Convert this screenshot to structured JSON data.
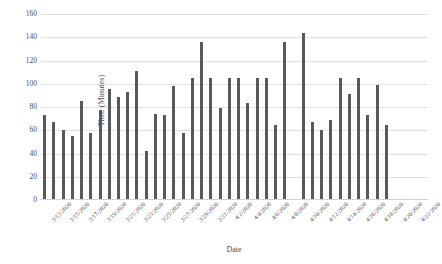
{
  "chart_data": {
    "type": "bar",
    "title": "",
    "xlabel": "Date",
    "ylabel": "Time (Minutes)",
    "ylim": [
      0,
      160
    ],
    "y_ticks": [
      0,
      20,
      40,
      60,
      80,
      100,
      120,
      140,
      160
    ],
    "grid": true,
    "legend": false,
    "bar_color": "#595959",
    "categories": [
      "3/13/2020",
      "3/14/2020",
      "3/15/2020",
      "3/16/2020",
      "3/17/2020",
      "3/18/2020",
      "3/19/2020",
      "3/20/2020",
      "3/21/2020",
      "3/22/2020",
      "3/23/2020",
      "3/24/2020",
      "3/25/2020",
      "3/26/2020",
      "3/27/2020",
      "3/28/2020",
      "3/29/2020",
      "3/30/2020",
      "3/31/2020",
      "4/1/2020",
      "4/2/2020",
      "4/3/2020",
      "4/4/2020",
      "4/5/2020",
      "4/6/2020",
      "4/7/2020",
      "4/8/2020",
      "4/9/2020",
      "4/10/2020",
      "4/11/2020",
      "4/12/2020",
      "4/13/2020",
      "4/14/2020",
      "4/15/2020",
      "4/16/2020",
      "4/17/2020",
      "4/18/2020",
      "4/19/2020",
      "4/20/2020",
      "4/21/2020",
      "4/22/2020",
      "4/23/2020"
    ],
    "tick_labels": [
      "3/13/2020",
      "3/15/2020",
      "3/17/2020",
      "3/19/2020",
      "3/21/2020",
      "3/23/2020",
      "3/25/2020",
      "3/27/2020",
      "3/29/2020",
      "3/31/2020",
      "4/2/2020",
      "4/4/2020",
      "4/6/2020",
      "4/8/2020",
      "4/10/2020",
      "4/12/2020",
      "4/14/2020",
      "4/16/2020",
      "4/18/2020",
      "4/20/2020",
      "4/22/2020"
    ],
    "values": [
      72,
      66,
      59,
      54,
      84,
      57,
      77,
      95,
      88,
      92,
      110,
      41,
      73,
      72,
      97,
      57,
      104,
      135,
      104,
      78,
      104,
      104,
      83,
      104,
      104,
      64,
      135,
      null,
      143,
      66,
      59,
      68,
      104,
      90,
      104,
      72,
      98,
      64,
      null,
      null,
      null,
      null
    ]
  }
}
